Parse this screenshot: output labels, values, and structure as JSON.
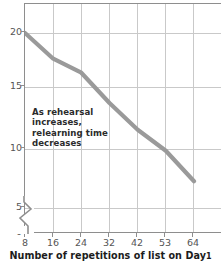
{
  "chart_data": {
    "type": "line",
    "title": "",
    "subtitle": "",
    "xlabel": "Number of repetitions of list on Day 1",
    "ylabel": "Time in minutes to relearn list on Day 2",
    "x": [
      8,
      16,
      24,
      32,
      42,
      53,
      64
    ],
    "categories": [
      "8",
      "16",
      "24",
      "32",
      "42",
      "53",
      "64"
    ],
    "values": [
      20.0,
      17.8,
      16.6,
      14.0,
      11.7,
      9.9,
      7.3
    ],
    "series": [
      {
        "name": "Relearning time",
        "values": [
          20.0,
          17.8,
          16.6,
          14.0,
          11.7,
          9.9,
          7.3
        ],
        "color": "#9a9a9a"
      }
    ],
    "ylim": [
      0,
      22
    ],
    "yticks": [
      0,
      5,
      10,
      15,
      20
    ],
    "ytick_labels": [
      "0",
      "5",
      "10",
      "15",
      "20"
    ],
    "xtick_labels": [
      "8",
      "16",
      "24",
      "32",
      "42",
      "53",
      "64"
    ],
    "grid": true,
    "legend": "none",
    "y_axis_break": true,
    "annotations": [
      {
        "text": "As rehearsal increases, relearning time decreases",
        "lines": [
          "As rehearsal",
          "increases,",
          "relearning time",
          "decreases"
        ]
      }
    ]
  },
  "axis": {
    "x_title_main": "Number of repetitions of list on Day",
    "x_title_suffix": "1",
    "y_title_clipped": "Time in minutes to relearn list on Day 2"
  },
  "colors": {
    "line": "#9a9a9a",
    "grid": "#c9c9c9",
    "frame": "#8e8e8e",
    "tick_text": "#555555",
    "annotation_text": "#2b2b2b",
    "title_text": "#1c1c1c",
    "background": "#ffffff"
  },
  "ticks": {
    "y": [
      {
        "label": "20"
      },
      {
        "label": "15"
      },
      {
        "label": "10"
      },
      {
        "label": "5"
      },
      {
        "label": "0"
      }
    ],
    "x": [
      {
        "label": "8"
      },
      {
        "label": "16"
      },
      {
        "label": "24"
      },
      {
        "label": "32"
      },
      {
        "label": "42"
      },
      {
        "label": "53"
      },
      {
        "label": "64"
      }
    ]
  },
  "annotation": {
    "line1": "As rehearsal",
    "line2": "increases,",
    "line3": "relearning time",
    "line4": "decreases"
  }
}
